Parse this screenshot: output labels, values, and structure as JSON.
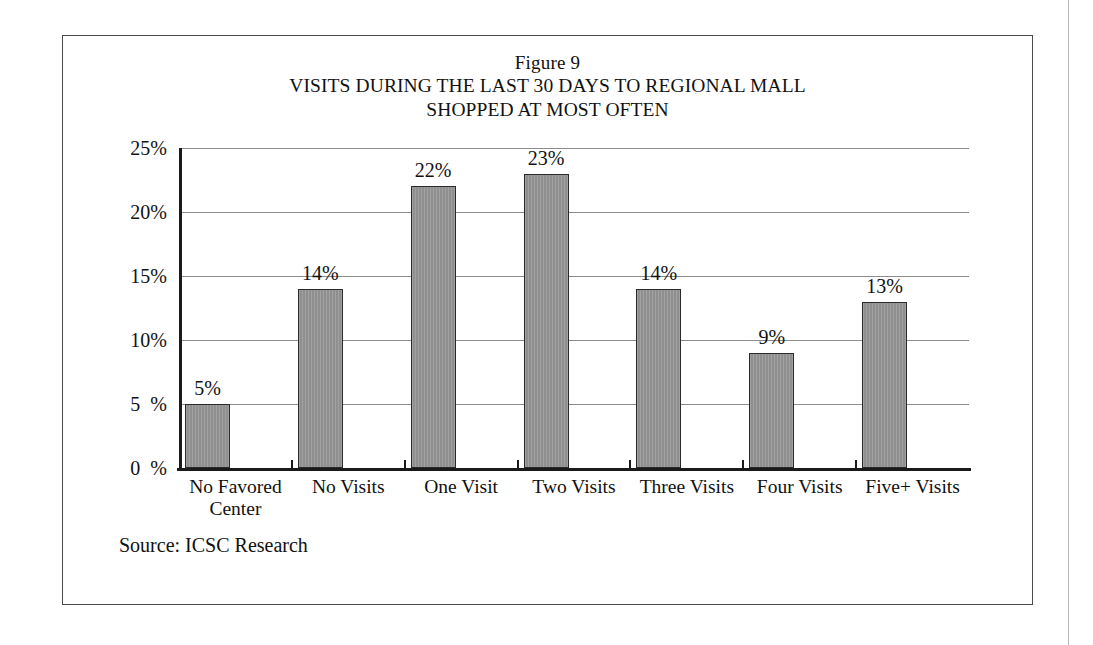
{
  "figure": {
    "title_line_1": "Figure 9",
    "title_line_2": "VISITS DURING THE LAST 30 DAYS TO REGIONAL MALL",
    "title_line_3": "SHOPPED AT MOST OFTEN",
    "source": "Source: ICSC Research",
    "frame_color": "#4a4a4a",
    "bar_fill_color": "#8f8f8f",
    "bar_edge_color": "#2a2a2a",
    "gridline_color": "#8c8c8c",
    "axis_color": "#1a1a1a"
  },
  "chart_data": {
    "type": "bar",
    "categories": [
      "No Favored\nCenter",
      "No Visits",
      "One Visit",
      "Two Visits",
      "Three Visits",
      "Four Visits",
      "Five+ Visits"
    ],
    "values": [
      5,
      14,
      22,
      23,
      14,
      9,
      13
    ],
    "value_labels": [
      "5%",
      "14%",
      "22%",
      "23%",
      "14%",
      "9%",
      "13%"
    ],
    "xlabel": "",
    "ylabel": "",
    "ylim": [
      0,
      25
    ],
    "ytick_values": [
      0,
      5,
      10,
      15,
      20,
      25
    ],
    "ytick_labels": [
      "0  %",
      "5  %",
      "10%",
      "15%",
      "20%",
      "25%"
    ],
    "grid": true,
    "legend": "none",
    "units": "percent"
  }
}
